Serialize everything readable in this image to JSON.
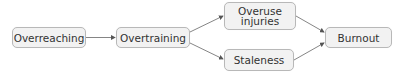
{
  "diagram": {
    "type": "flowchart",
    "nodes": [
      {
        "id": "overreaching",
        "label": "Overreaching"
      },
      {
        "id": "overtraining",
        "label": "Overtraining"
      },
      {
        "id": "overuse_injuries",
        "label": "Overuse\ninjuries"
      },
      {
        "id": "staleness",
        "label": "Staleness"
      },
      {
        "id": "burnout",
        "label": "Burnout"
      }
    ],
    "edges": [
      {
        "from": "overreaching",
        "to": "overtraining"
      },
      {
        "from": "overtraining",
        "to": "overuse_injuries"
      },
      {
        "from": "overtraining",
        "to": "staleness"
      },
      {
        "from": "overuse_injuries",
        "to": "burnout"
      },
      {
        "from": "staleness",
        "to": "burnout"
      }
    ]
  },
  "colors": {
    "node_fill": "#f2f2f2",
    "node_border": "#b8b8b8",
    "text": "#333333",
    "arrow": "#555555"
  }
}
